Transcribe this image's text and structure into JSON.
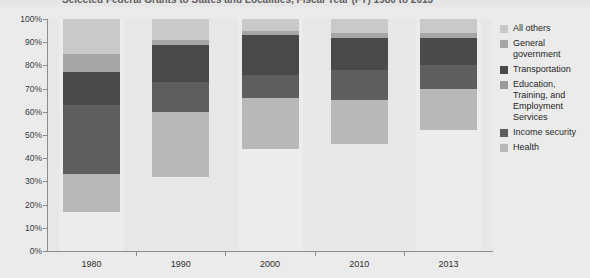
{
  "title": "Selected Federal Grants to States and Localities, Fiscal Year (FY) 1980 to 2013",
  "axes": {
    "y_ticks": [
      "100%",
      "90%",
      "80%",
      "70%",
      "60%",
      "50%",
      "40%",
      "30%",
      "20%",
      "10%",
      "0%"
    ],
    "x_ticks": [
      "1980",
      "1990",
      "2000",
      "2010",
      "2013"
    ]
  },
  "legend": {
    "items": [
      {
        "label": "All others",
        "color": "#c9c9c9"
      },
      {
        "label": "General government",
        "color": "#a6a6a6"
      },
      {
        "label": "Transportation",
        "color": "#4a4a4a"
      },
      {
        "label": "Education, Training, and Employment Services",
        "color": "#9a9a9a"
      },
      {
        "label": "Income security",
        "color": "#5e5e5e"
      },
      {
        "label": "Health",
        "color": "#b8b8b8"
      }
    ]
  },
  "chart_data": {
    "type": "bar",
    "title": "Selected Federal Grants to States and Localities, Fiscal Year (FY) 1980 to 2013",
    "xlabel": "",
    "ylabel": "",
    "ylim": [
      0,
      100
    ],
    "grid": false,
    "legend_position": "right",
    "stacked": true,
    "note": "Bars are stacked from the bottom of each segment shown; the unshaded area below each bar is not part of the selected categories.",
    "categories": [
      "1980",
      "1990",
      "2000",
      "2010",
      "2013"
    ],
    "series": [
      {
        "name": "Health",
        "color": "#b8b8b8",
        "bottoms": [
          17,
          32,
          44,
          46,
          52
        ],
        "tops": [
          33,
          60,
          66,
          65,
          70
        ],
        "values": [
          16,
          28,
          22,
          19,
          18
        ]
      },
      {
        "name": "Income security",
        "color": "#5e5e5e",
        "bottoms": [
          33,
          60,
          66,
          65,
          70
        ],
        "tops": [
          63,
          73,
          76,
          78,
          80
        ],
        "values": [
          30,
          13,
          10,
          13,
          10
        ]
      },
      {
        "name": "Education, Training, and Employment Services",
        "color": "#9a9a9a",
        "bottoms": [
          63,
          73,
          76,
          78,
          80
        ],
        "tops": [
          63,
          73,
          76,
          78,
          80
        ],
        "values": [
          0,
          0,
          0,
          0,
          0
        ]
      },
      {
        "name": "Transportation",
        "color": "#4a4a4a",
        "bottoms": [
          63,
          73,
          76,
          78,
          80
        ],
        "tops": [
          77,
          89,
          93,
          92,
          92
        ],
        "values": [
          14,
          16,
          17,
          14,
          12
        ]
      },
      {
        "name": "General government",
        "color": "#a6a6a6",
        "bottoms": [
          77,
          89,
          93,
          92,
          92
        ],
        "tops": [
          85,
          91,
          95,
          94,
          94
        ],
        "values": [
          8,
          2,
          2,
          2,
          2
        ]
      },
      {
        "name": "All others",
        "color": "#c9c9c9",
        "bottoms": [
          85,
          91,
          95,
          94,
          94
        ],
        "tops": [
          100,
          100,
          100,
          100,
          100
        ],
        "values": [
          15,
          9,
          5,
          6,
          6
        ]
      }
    ]
  }
}
